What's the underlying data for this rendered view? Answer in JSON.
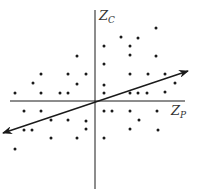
{
  "diagram": {
    "type": "scatter-with-regression-axis",
    "colors": {
      "background": "#ffffff",
      "ink": "#1a1a1a",
      "label": "#333333"
    },
    "axes": {
      "vertical": {
        "label_main": "Z",
        "label_sub": "C",
        "x": 95,
        "y_top": 10,
        "y_bottom": 189
      },
      "horizontal": {
        "label_main": "Z",
        "label_sub": "P",
        "y": 101,
        "x_left": 10,
        "x_right": 185
      }
    },
    "arrow_line": {
      "description": "double-headed principal axis through origin",
      "from": [
        3,
        133
      ],
      "to": [
        188,
        71
      ]
    },
    "points": [
      [
        156,
        28
      ],
      [
        121,
        37
      ],
      [
        138,
        38
      ],
      [
        104,
        46
      ],
      [
        130,
        46
      ],
      [
        130,
        55
      ],
      [
        156,
        56
      ],
      [
        77,
        56
      ],
      [
        104,
        64
      ],
      [
        41,
        74
      ],
      [
        68,
        74
      ],
      [
        86,
        74
      ],
      [
        130,
        74
      ],
      [
        148,
        74
      ],
      [
        165,
        74
      ],
      [
        33,
        83
      ],
      [
        77,
        84
      ],
      [
        104,
        85
      ],
      [
        175,
        83
      ],
      [
        15,
        93
      ],
      [
        41,
        93
      ],
      [
        60,
        93
      ],
      [
        68,
        93
      ],
      [
        104,
        93
      ],
      [
        130,
        93
      ],
      [
        138,
        93
      ],
      [
        147,
        93
      ],
      [
        165,
        92
      ],
      [
        24,
        111
      ],
      [
        41,
        111
      ],
      [
        104,
        111
      ],
      [
        112,
        111
      ],
      [
        130,
        111
      ],
      [
        157,
        111
      ],
      [
        51,
        120
      ],
      [
        68,
        120
      ],
      [
        86,
        121
      ],
      [
        139,
        120
      ],
      [
        24,
        130
      ],
      [
        32,
        130
      ],
      [
        86,
        129
      ],
      [
        130,
        129
      ],
      [
        158,
        130
      ],
      [
        51,
        138
      ],
      [
        77,
        138
      ],
      [
        104,
        138
      ],
      [
        15,
        149
      ]
    ]
  }
}
